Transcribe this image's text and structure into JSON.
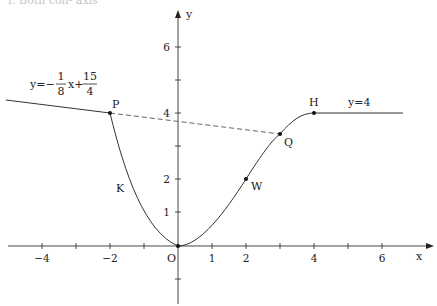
{
  "header_fragment": "r. Both con- axis",
  "axes": {
    "x_label": "x",
    "y_label": "y",
    "origin_label": "O",
    "x_ticks": [
      {
        "value": -4,
        "label": "−4"
      },
      {
        "value": -3,
        "label": ""
      },
      {
        "value": -2,
        "label": "−2"
      },
      {
        "value": -1,
        "label": ""
      },
      {
        "value": 1,
        "label": "1"
      },
      {
        "value": 2,
        "label": "2"
      },
      {
        "value": 3,
        "label": ""
      },
      {
        "value": 4,
        "label": "4"
      },
      {
        "value": 5,
        "label": ""
      },
      {
        "value": 6,
        "label": "6"
      }
    ],
    "y_ticks": [
      {
        "value": -1,
        "label": ""
      },
      {
        "value": 1,
        "label": "1"
      },
      {
        "value": 2,
        "label": "2"
      },
      {
        "value": 3,
        "label": ""
      },
      {
        "value": 4,
        "label": "4"
      },
      {
        "value": 5,
        "label": ""
      },
      {
        "value": 6,
        "label": "6"
      }
    ]
  },
  "points": {
    "P": {
      "label": "P",
      "x": -2,
      "y": 4
    },
    "Q": {
      "label": "Q",
      "x": 3,
      "y": 3.375
    },
    "H": {
      "label": "H",
      "x": 4,
      "y": 4
    },
    "W": {
      "label": "W",
      "x": 2,
      "y": 2
    },
    "O": {
      "label": "O",
      "x": 0,
      "y": 0
    }
  },
  "curve_labels": {
    "K": "K"
  },
  "equations": {
    "left_line": {
      "prefix": "y=−",
      "frac1_num": "1",
      "frac1_den": "8",
      "mid": "x+",
      "frac2_num": "15",
      "frac2_den": "4"
    },
    "right_line": "y=4"
  },
  "colors": {
    "curve": "#333333",
    "axis": "#333333",
    "dashed": "#555555",
    "background": "#ffffff"
  }
}
